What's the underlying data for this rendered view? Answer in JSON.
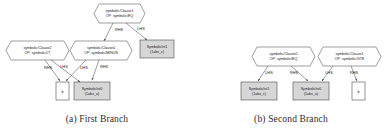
{
  "figure": {
    "panels": [
      {
        "id": "a",
        "caption": "(a) First Branch",
        "nodes": [
          {
            "id": "a-clause1",
            "shape": "hexagon",
            "line1": "symbolic/Clause1",
            "line2": "OP: symbolic/EQ"
          },
          {
            "id": "a-clause2",
            "shape": "hexagon",
            "line1": "symbolic/Clause2",
            "line2": "OP: symbolic/LT"
          },
          {
            "id": "a-clause0",
            "shape": "hexagon",
            "line1": "symbolic/Clause0",
            "line2": "OP: symbolic/MINUS"
          },
          {
            "id": "a-int1",
            "shape": "box-shaded",
            "line1": "SymbolicInt1",
            "line2": "(1abs_c)"
          },
          {
            "id": "a-int0",
            "shape": "box-shaded",
            "line1": "SymbolicInt0",
            "line2": "(1abs_a)"
          },
          {
            "id": "a-b",
            "shape": "box-plain",
            "line1": "b",
            "line2": ""
          }
        ],
        "edges": [
          {
            "id": "a-e1",
            "from": "a-clause1",
            "to": "a-clause0",
            "label": "RHS"
          },
          {
            "id": "a-e2",
            "from": "a-clause1",
            "to": "a-int1",
            "label": "LHS"
          },
          {
            "id": "a-e3",
            "from": "a-clause2",
            "to": "a-b",
            "label": "RHS"
          },
          {
            "id": "a-e4",
            "from": "a-clause2",
            "to": "a-int0",
            "label": "LHS"
          },
          {
            "id": "a-e5",
            "from": "a-clause0",
            "to": "a-b",
            "label": "LHS"
          },
          {
            "id": "a-e6",
            "from": "a-clause0",
            "to": "a-int0",
            "label": "RHS"
          }
        ]
      },
      {
        "id": "b",
        "caption": "(b) Second Branch",
        "nodes": [
          {
            "id": "b-clause0",
            "shape": "hexagon",
            "line1": "symbolic/Clause0",
            "line2": "OP: symbolic/EQ"
          },
          {
            "id": "b-clause1",
            "shape": "hexagon",
            "line1": "symbolic/Clause1",
            "line2": "OP: symbolic/GTE"
          },
          {
            "id": "b-int1",
            "shape": "box-shaded",
            "line1": "SymbolicInt1",
            "line2": "(1abs_c)"
          },
          {
            "id": "b-int0",
            "shape": "box-shaded",
            "line1": "SymbolicInt0",
            "line2": "(1abs_a)"
          },
          {
            "id": "b-b",
            "shape": "box-plain",
            "line1": "b",
            "line2": ""
          }
        ],
        "edges": [
          {
            "id": "b-e1",
            "from": "b-clause0",
            "to": "b-int1",
            "label": "LHS"
          },
          {
            "id": "b-e2",
            "from": "b-clause0",
            "to": "b-int0",
            "label": "RHS"
          },
          {
            "id": "b-e3",
            "from": "b-clause1",
            "to": "b-int0",
            "label": "LHS"
          },
          {
            "id": "b-e4",
            "from": "b-clause1",
            "to": "b-b",
            "label": "RHS"
          }
        ]
      }
    ]
  }
}
